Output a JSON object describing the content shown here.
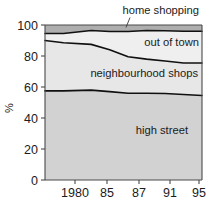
{
  "chart_data": {
    "type": "area",
    "title": "",
    "subtitle": "",
    "xlabel": "",
    "ylabel": "%",
    "stacked": true,
    "normalized_percent": true,
    "grid": false,
    "legend_position": "inline-labels",
    "xlim": [
      1978,
      1995
    ],
    "ylim": [
      0,
      100
    ],
    "yticks": [
      0,
      20,
      40,
      60,
      80,
      100
    ],
    "ytick_labels": [
      "0",
      "20",
      "40",
      "60",
      "80",
      "100"
    ],
    "x": [
      1978,
      1980,
      1983,
      1985,
      1987,
      1989,
      1991,
      1993,
      1995
    ],
    "xticks": [
      1980,
      1985,
      1987,
      1991,
      1995
    ],
    "xtick_labels": [
      "1980",
      "85",
      "87",
      "91",
      "95"
    ],
    "series": [
      {
        "name": "high street",
        "label": "high street",
        "color": "#d2d2d2",
        "values": [
          57.5,
          57.5,
          58.0,
          57.0,
          56.0,
          56.0,
          55.8,
          55.2,
          54.5
        ]
      },
      {
        "name": "neighbourhood shops",
        "label": "neighbourhood shops",
        "color": "#e7e7e7",
        "values": [
          32.5,
          31.0,
          29.5,
          27.0,
          23.5,
          22.0,
          21.0,
          20.3,
          21.0
        ]
      },
      {
        "name": "out of town",
        "label": "out of town",
        "color": "#efefef",
        "values": [
          8.0,
          9.5,
          10.5,
          13.0,
          16.5,
          17.5,
          19.2,
          20.0,
          20.5
        ]
      },
      {
        "name": "home shopping",
        "label": "home shopping",
        "color": "#aeaeae",
        "values": [
          2.0,
          2.0,
          2.0,
          3.0,
          4.0,
          4.5,
          4.0,
          4.5,
          4.0
        ]
      }
    ],
    "cumulative_boundaries": {
      "note": "upper edge of each band, bottom-to-top, as percent",
      "high_street_top": [
        57.5,
        57.5,
        58.0,
        57.0,
        56.0,
        56.0,
        55.8,
        55.2,
        54.5
      ],
      "neighbourhood_top": [
        90.0,
        88.5,
        87.5,
        84.0,
        79.5,
        78.0,
        76.8,
        75.5,
        75.5
      ],
      "out_of_town_top": [
        94.5,
        94.5,
        96.5,
        95.8,
        95.8,
        96.5,
        96.3,
        96.0,
        96.0
      ],
      "home_shopping_top": [
        100,
        100,
        100,
        100,
        100,
        100,
        100,
        100,
        100
      ]
    },
    "annotations": [
      {
        "name": "home-shopping-callout",
        "text": "home shopping",
        "leader_line": true
      }
    ]
  },
  "labels": {
    "home_shopping": "home shopping",
    "out_of_town": "out of town",
    "neighbourhood_shops": "neighbourhood shops",
    "high_street": "high street",
    "y_axis": "%"
  }
}
